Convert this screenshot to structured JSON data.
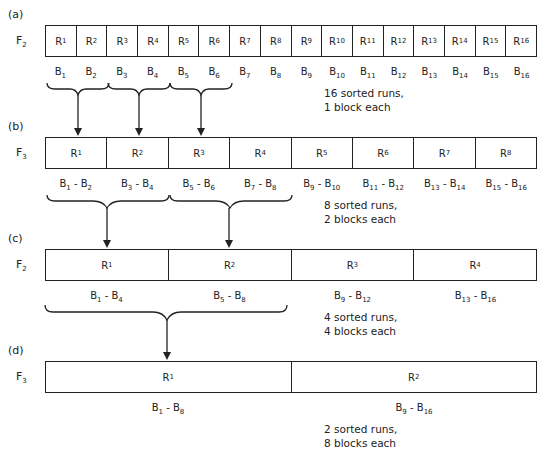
{
  "passes": [
    {
      "label": "(a)",
      "file": "F",
      "file_sub": "2",
      "runs": [
        "1",
        "2",
        "3",
        "4",
        "5",
        "6",
        "7",
        "8",
        "9",
        "10",
        "11",
        "12",
        "13",
        "14",
        "15",
        "16"
      ],
      "blocks": [
        [
          "1"
        ],
        [
          "2"
        ],
        [
          "3"
        ],
        [
          "4"
        ],
        [
          "5"
        ],
        [
          "6"
        ],
        [
          "7"
        ],
        [
          "8"
        ],
        [
          "9"
        ],
        [
          "10"
        ],
        [
          "11"
        ],
        [
          "12"
        ],
        [
          "13"
        ],
        [
          "14"
        ],
        [
          "15"
        ],
        [
          "16"
        ]
      ],
      "note": [
        "16 sorted runs,",
        "1 block each"
      ]
    },
    {
      "label": "(b)",
      "file": "F",
      "file_sub": "3",
      "runs": [
        "1",
        "2",
        "3",
        "4",
        "5",
        "6",
        "7",
        "8"
      ],
      "blocks": [
        [
          "1",
          "2"
        ],
        [
          "3",
          "4"
        ],
        [
          "5",
          "6"
        ],
        [
          "7",
          "8"
        ],
        [
          "9",
          "10"
        ],
        [
          "11",
          "12"
        ],
        [
          "13",
          "14"
        ],
        [
          "15",
          "16"
        ]
      ],
      "note": [
        "8 sorted runs,",
        "2 blocks each"
      ]
    },
    {
      "label": "(c)",
      "file": "F",
      "file_sub": "2",
      "runs": [
        "1",
        "2",
        "3",
        "4"
      ],
      "blocks": [
        [
          "1",
          "4"
        ],
        [
          "5",
          "8"
        ],
        [
          "9",
          "12"
        ],
        [
          "13",
          "16"
        ]
      ],
      "note": [
        "4 sorted runs,",
        "4 blocks each"
      ]
    },
    {
      "label": "(d)",
      "file": "F",
      "file_sub": "3",
      "runs": [
        "1",
        "2"
      ],
      "blocks": [
        [
          "1",
          "8"
        ],
        [
          "9",
          "16"
        ]
      ],
      "note": [
        "2 sorted runs,",
        "8 blocks each"
      ]
    }
  ],
  "run_prefix": "R",
  "block_prefix": "B",
  "range_sep": " - "
}
